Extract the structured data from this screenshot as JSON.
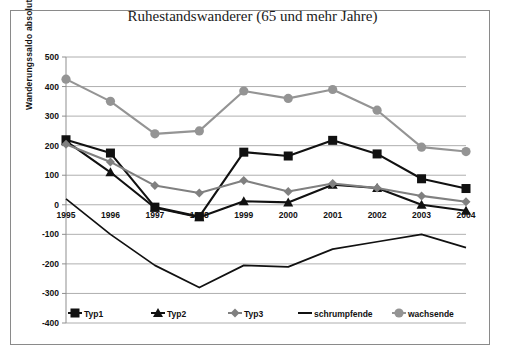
{
  "chart_data": {
    "type": "line",
    "title": "Ruhestandswanderer (65 und mehr Jahre)",
    "xlabel": "",
    "ylabel": "Wanderungssaldo absolut",
    "categories": [
      "1995",
      "1996",
      "1997",
      "1998",
      "1999",
      "2000",
      "2001",
      "2002",
      "2003",
      "2004"
    ],
    "ylim": [
      -400,
      500
    ],
    "ytick_step": 100,
    "yticks": [
      "500",
      "400",
      "300",
      "200",
      "100",
      "0",
      "-100",
      "-200",
      "-300",
      "-400"
    ],
    "grid": true,
    "legend_position": "bottom",
    "series": [
      {
        "name": "Typ1",
        "marker": "square",
        "color": "#111111",
        "values": [
          220,
          175,
          -8,
          -40,
          178,
          165,
          218,
          172,
          88,
          55
        ]
      },
      {
        "name": "Typ2",
        "marker": "triangle",
        "color": "#111111",
        "values": [
          215,
          110,
          -10,
          -42,
          12,
          8,
          68,
          57,
          0,
          -20
        ]
      },
      {
        "name": "Typ3",
        "marker": "diamond",
        "color": "#808080",
        "values": [
          205,
          145,
          65,
          40,
          82,
          45,
          72,
          57,
          30,
          10
        ]
      },
      {
        "name": "schrumpfende",
        "marker": "none",
        "color": "#111111",
        "values": [
          20,
          -100,
          -205,
          -280,
          -205,
          -210,
          -150,
          -125,
          -100,
          -145
        ]
      },
      {
        "name": "wachsende",
        "marker": "circle",
        "color": "#949494",
        "values": [
          425,
          350,
          240,
          250,
          385,
          360,
          390,
          320,
          195,
          180
        ]
      }
    ]
  }
}
